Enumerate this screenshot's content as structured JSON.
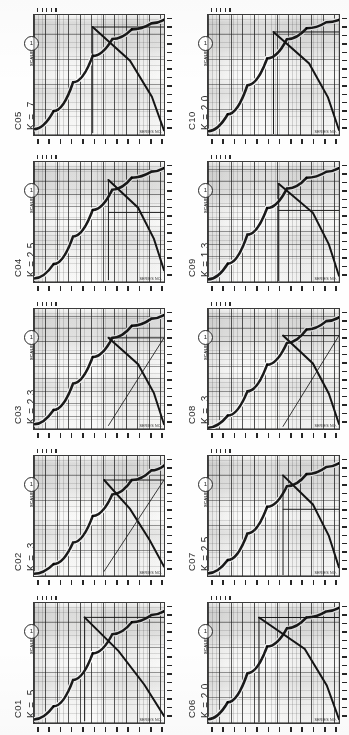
{
  "document": {
    "type": "scanned-figure-sheet",
    "layout": "2 columns x 5 rows of rotated nomograph charts",
    "orientation": "charts rotated 90 degrees counter-clockwise",
    "panel_count": 10,
    "background_color": "#fefefe",
    "ink_color": "#2a2a2a"
  },
  "chart_data": [
    {
      "id": "C01",
      "type": "line",
      "title": "C01",
      "k_label": "K = .5",
      "k_value": 0.5,
      "xlabel": "",
      "ylabel": "",
      "grid": true,
      "log_scale": true,
      "xlim": [
        1,
        100
      ],
      "ylim": [
        1,
        100
      ],
      "legend_position": "none",
      "annotations": [
        "callout-circle"
      ],
      "series": [
        {
          "name": "rising-response",
          "style": "thick-curve",
          "x": [
            1,
            2,
            4,
            8,
            16,
            32,
            64,
            100
          ],
          "y": [
            3,
            14,
            36,
            58,
            74,
            84,
            90,
            93
          ]
        },
        {
          "name": "falling-asymptote",
          "style": "thick-straight",
          "x": [
            6,
            20,
            50,
            100
          ],
          "y": [
            88,
            60,
            32,
            6
          ]
        },
        {
          "name": "plateau-line",
          "style": "thin-horizontal",
          "x": [
            6,
            100
          ],
          "y": [
            88,
            88
          ]
        },
        {
          "name": "vertical-cutoff",
          "style": "thin-vertical",
          "x": [
            6,
            6
          ],
          "y": [
            2,
            88
          ]
        }
      ]
    },
    {
      "id": "C02",
      "type": "line",
      "title": "C02",
      "k_label": "K = .3",
      "k_value": 0.3,
      "xlabel": "",
      "ylabel": "",
      "grid": true,
      "log_scale": true,
      "xlim": [
        1,
        100
      ],
      "ylim": [
        1,
        100
      ],
      "legend_position": "none",
      "annotations": [
        "callout-circle"
      ],
      "series": [
        {
          "name": "rising-response",
          "style": "thick-curve",
          "x": [
            1,
            2,
            4,
            8,
            16,
            32,
            64,
            100
          ],
          "y": [
            2,
            10,
            28,
            50,
            68,
            80,
            88,
            92
          ]
        },
        {
          "name": "falling-asymptote",
          "style": "thick-straight",
          "x": [
            12,
            30,
            60,
            100
          ],
          "y": [
            80,
            56,
            30,
            8
          ]
        },
        {
          "name": "plateau-line",
          "style": "thin-horizontal",
          "x": [
            12,
            100
          ],
          "y": [
            80,
            80
          ]
        },
        {
          "name": "diagonal-rise",
          "style": "thin-diagonal",
          "x": [
            12,
            100
          ],
          "y": [
            4,
            80
          ]
        }
      ]
    },
    {
      "id": "C03",
      "type": "line",
      "title": "C03",
      "k_label": "K = 2.3",
      "k_value": 2.3,
      "xlabel": "",
      "ylabel": "",
      "grid": true,
      "log_scale": true,
      "xlim": [
        1,
        100
      ],
      "ylim": [
        1,
        100
      ],
      "legend_position": "none",
      "annotations": [
        "callout-circle"
      ],
      "series": [
        {
          "name": "rising-response",
          "style": "thick-curve",
          "x": [
            1,
            2,
            4,
            8,
            16,
            32,
            64,
            100
          ],
          "y": [
            4,
            16,
            38,
            60,
            76,
            86,
            92,
            95
          ]
        },
        {
          "name": "falling-asymptote",
          "style": "thick-straight",
          "x": [
            14,
            40,
            70,
            100
          ],
          "y": [
            76,
            54,
            30,
            4
          ]
        },
        {
          "name": "plateau-line",
          "style": "thin-horizontal",
          "x": [
            14,
            100
          ],
          "y": [
            76,
            76
          ]
        },
        {
          "name": "diagonal-rise",
          "style": "thin-diagonal",
          "x": [
            14,
            100
          ],
          "y": [
            3,
            76
          ]
        }
      ]
    },
    {
      "id": "C04",
      "type": "line",
      "title": "C04",
      "k_label": "K = 2.5",
      "k_value": 2.5,
      "xlabel": "",
      "ylabel": "",
      "grid": true,
      "log_scale": true,
      "xlim": [
        1,
        100
      ],
      "ylim": [
        1,
        100
      ],
      "legend_position": "none",
      "annotations": [
        "callout-circle"
      ],
      "series": [
        {
          "name": "rising-response",
          "style": "thick-curve",
          "x": [
            1,
            2,
            4,
            8,
            16,
            32,
            64,
            100
          ],
          "y": [
            3,
            15,
            38,
            60,
            77,
            87,
            92,
            95
          ]
        },
        {
          "name": "falling-asymptote",
          "style": "thick-straight",
          "x": [
            14,
            40,
            70,
            100
          ],
          "y": [
            85,
            62,
            36,
            10
          ]
        },
        {
          "name": "plateau-line",
          "style": "thin-horizontal",
          "x": [
            14,
            100
          ],
          "y": [
            58,
            58
          ]
        },
        {
          "name": "vertical-cutoff",
          "style": "thin-vertical",
          "x": [
            14,
            14
          ],
          "y": [
            2,
            85
          ]
        }
      ]
    },
    {
      "id": "C05",
      "type": "line",
      "title": "C05",
      "k_label": "K = .7",
      "k_value": 0.7,
      "xlabel": "",
      "ylabel": "",
      "grid": true,
      "log_scale": true,
      "xlim": [
        1,
        100
      ],
      "ylim": [
        1,
        100
      ],
      "legend_position": "none",
      "annotations": [
        "callout-circle"
      ],
      "series": [
        {
          "name": "rising-response",
          "style": "thick-curve",
          "x": [
            1,
            2,
            4,
            8,
            16,
            32,
            64,
            100
          ],
          "y": [
            5,
            20,
            44,
            66,
            80,
            88,
            93,
            96
          ]
        },
        {
          "name": "falling-asymptote",
          "style": "thick-straight",
          "x": [
            8,
            30,
            65,
            100
          ],
          "y": [
            90,
            62,
            32,
            4
          ]
        },
        {
          "name": "plateau-line",
          "style": "thin-horizontal",
          "x": [
            8,
            100
          ],
          "y": [
            90,
            90
          ]
        },
        {
          "name": "vertical-cutoff",
          "style": "thin-vertical",
          "x": [
            8,
            8
          ],
          "y": [
            2,
            90
          ]
        }
      ]
    },
    {
      "id": "C06",
      "type": "line",
      "title": "C06",
      "k_label": "K = 2.0",
      "k_value": 2.0,
      "xlabel": "",
      "ylabel": "",
      "grid": true,
      "log_scale": true,
      "xlim": [
        1,
        100
      ],
      "ylim": [
        1,
        100
      ],
      "legend_position": "none",
      "annotations": [
        "callout-circle"
      ],
      "series": [
        {
          "name": "rising-response",
          "style": "thick-curve",
          "x": [
            1,
            2,
            4,
            8,
            16,
            32,
            64,
            100
          ],
          "y": [
            4,
            18,
            42,
            64,
            79,
            88,
            93,
            96
          ]
        },
        {
          "name": "falling-asymptote",
          "style": "thick-straight",
          "x": [
            6,
            30,
            65,
            100
          ],
          "y": [
            88,
            62,
            32,
            4
          ]
        },
        {
          "name": "plateau-line",
          "style": "thin-horizontal",
          "x": [
            6,
            100
          ],
          "y": [
            88,
            88
          ]
        },
        {
          "name": "vertical-cutoff",
          "style": "thin-vertical",
          "x": [
            6,
            6
          ],
          "y": [
            2,
            88
          ]
        }
      ]
    },
    {
      "id": "C07",
      "type": "line",
      "title": "C07",
      "k_label": "K = 2.5",
      "k_value": 2.5,
      "xlabel": "",
      "ylabel": "",
      "grid": true,
      "log_scale": true,
      "xlim": [
        1,
        100
      ],
      "ylim": [
        1,
        100
      ],
      "legend_position": "none",
      "annotations": [
        "callout-circle"
      ],
      "series": [
        {
          "name": "rising-response",
          "style": "thick-curve",
          "x": [
            1,
            2,
            4,
            8,
            16,
            32,
            64,
            100
          ],
          "y": [
            3,
            14,
            36,
            58,
            75,
            85,
            91,
            94
          ]
        },
        {
          "name": "falling-asymptote",
          "style": "thick-straight",
          "x": [
            14,
            40,
            70,
            100
          ],
          "y": [
            84,
            60,
            34,
            8
          ]
        },
        {
          "name": "plateau-line",
          "style": "thin-horizontal",
          "x": [
            14,
            100
          ],
          "y": [
            56,
            56
          ]
        },
        {
          "name": "vertical-cutoff",
          "style": "thin-vertical",
          "x": [
            14,
            14
          ],
          "y": [
            2,
            84
          ]
        }
      ]
    },
    {
      "id": "C08",
      "type": "line",
      "title": "C08",
      "k_label": "K = .3",
      "k_value": 0.3,
      "xlabel": "",
      "ylabel": "",
      "grid": true,
      "log_scale": true,
      "xlim": [
        1,
        100
      ],
      "ylim": [
        1,
        100
      ],
      "legend_position": "none",
      "annotations": [
        "callout-circle"
      ],
      "series": [
        {
          "name": "rising-response",
          "style": "thick-curve",
          "x": [
            1,
            2,
            4,
            8,
            16,
            32,
            64,
            100
          ],
          "y": [
            2,
            12,
            32,
            54,
            72,
            83,
            90,
            93
          ]
        },
        {
          "name": "falling-asymptote",
          "style": "thick-straight",
          "x": [
            14,
            40,
            70,
            100
          ],
          "y": [
            78,
            55,
            30,
            5
          ]
        },
        {
          "name": "plateau-line",
          "style": "thin-horizontal",
          "x": [
            14,
            100
          ],
          "y": [
            78,
            78
          ]
        },
        {
          "name": "diagonal-rise",
          "style": "thin-diagonal",
          "x": [
            14,
            100
          ],
          "y": [
            3,
            78
          ]
        }
      ]
    },
    {
      "id": "C09",
      "type": "line",
      "title": "C09",
      "k_label": "K = 1.3",
      "k_value": 1.3,
      "xlabel": "",
      "ylabel": "",
      "grid": true,
      "log_scale": true,
      "xlim": [
        1,
        100
      ],
      "ylim": [
        1,
        100
      ],
      "legend_position": "none",
      "annotations": [
        "callout-circle"
      ],
      "series": [
        {
          "name": "rising-response",
          "style": "thick-curve",
          "x": [
            1,
            2,
            4,
            8,
            16,
            32,
            64,
            100
          ],
          "y": [
            3,
            16,
            40,
            62,
            78,
            87,
            92,
            95
          ]
        },
        {
          "name": "falling-asymptote",
          "style": "thick-straight",
          "x": [
            12,
            40,
            70,
            100
          ],
          "y": [
            82,
            58,
            32,
            6
          ]
        },
        {
          "name": "plateau-line",
          "style": "thin-horizontal",
          "x": [
            12,
            100
          ],
          "y": [
            60,
            60
          ]
        },
        {
          "name": "vertical-cutoff",
          "style": "thin-vertical",
          "x": [
            12,
            12
          ],
          "y": [
            2,
            82
          ]
        }
      ]
    },
    {
      "id": "C10",
      "type": "line",
      "title": "C10",
      "k_label": "K = 2.0",
      "k_value": 2.0,
      "xlabel": "",
      "ylabel": "",
      "grid": true,
      "log_scale": true,
      "xlim": [
        1,
        100
      ],
      "ylim": [
        1,
        100
      ],
      "legend_position": "none",
      "annotations": [
        "callout-circle"
      ],
      "series": [
        {
          "name": "rising-response",
          "style": "thick-curve",
          "x": [
            1,
            2,
            4,
            8,
            16,
            32,
            64,
            100
          ],
          "y": [
            4,
            18,
            42,
            64,
            80,
            89,
            94,
            96
          ]
        },
        {
          "name": "falling-asymptote",
          "style": "thick-straight",
          "x": [
            10,
            35,
            68,
            100
          ],
          "y": [
            86,
            60,
            32,
            5
          ]
        },
        {
          "name": "plateau-line",
          "style": "thin-horizontal",
          "x": [
            10,
            100
          ],
          "y": [
            86,
            86
          ]
        },
        {
          "name": "vertical-cutoff",
          "style": "thin-vertical",
          "x": [
            10,
            10
          ],
          "y": [
            2,
            86
          ]
        }
      ]
    }
  ],
  "panels": [
    {
      "id": "C05",
      "k_label": "K = .7",
      "column": "left",
      "row": 1
    },
    {
      "id": "C04",
      "k_label": "K = 2.5",
      "column": "left",
      "row": 2
    },
    {
      "id": "C03",
      "k_label": "K = 2.3",
      "column": "left",
      "row": 3
    },
    {
      "id": "C02",
      "k_label": "K = .3",
      "column": "left",
      "row": 4
    },
    {
      "id": "C01",
      "k_label": "K = .5",
      "column": "left",
      "row": 5
    },
    {
      "id": "C10",
      "k_label": "K = 2.0",
      "column": "right",
      "row": 1
    },
    {
      "id": "C09",
      "k_label": "K = 1.3",
      "column": "right",
      "row": 2
    },
    {
      "id": "C08",
      "k_label": "K = .3",
      "column": "right",
      "row": 3
    },
    {
      "id": "C07",
      "k_label": "K = 2.5",
      "column": "right",
      "row": 4
    },
    {
      "id": "C06",
      "k_label": "K = 2.0",
      "column": "right",
      "row": 5
    }
  ],
  "axis_legend_text": "SCALE",
  "corner_note_text": "SERIES NO.",
  "callout_text": "1"
}
